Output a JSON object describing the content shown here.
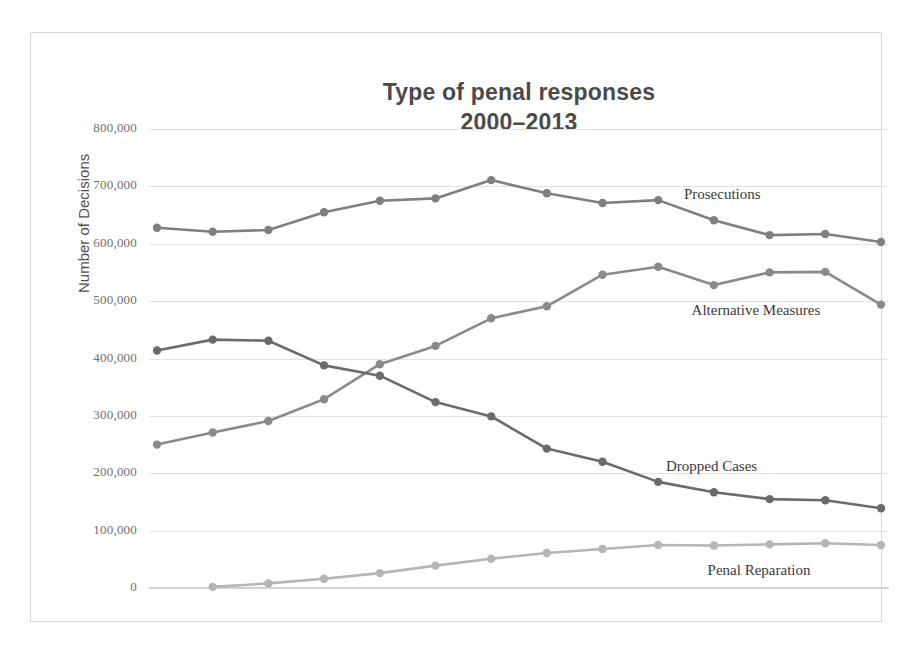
{
  "chart_data": {
    "type": "line",
    "title": "Type of penal responses",
    "subtitle": "2000–2013",
    "xlabel": "",
    "ylabel": "Number of Decisions",
    "categories": [
      "2000",
      "2001",
      "2002",
      "2003",
      "2004",
      "2005",
      "2006",
      "2007",
      "2008",
      "2009",
      "2010",
      "2011",
      "2012",
      "2013"
    ],
    "ylim": [
      0,
      800000
    ],
    "yticks": [
      0,
      100000,
      200000,
      300000,
      400000,
      500000,
      600000,
      700000,
      800000
    ],
    "ytick_labels": [
      "0",
      "100,000",
      "200,000",
      "300,000",
      "400,000",
      "500,000",
      "600,000",
      "700,000",
      "800,000"
    ],
    "grid": true,
    "legend_position": "inline-right-of-series",
    "series": [
      {
        "name": "Prosecutions",
        "color": "#7f7f7f",
        "values": [
          628000,
          621000,
          624000,
          655000,
          675000,
          679000,
          711000,
          688000,
          671000,
          676000,
          641000,
          615000,
          617000,
          603000
        ]
      },
      {
        "name": "Alternative Measures",
        "color": "#8a8a8a",
        "values": [
          250000,
          271000,
          291000,
          329000,
          390000,
          422000,
          470000,
          491000,
          546000,
          560000,
          528000,
          550000,
          551000,
          494000
        ]
      },
      {
        "name": "Dropped Cases",
        "color": "#6b6b6b",
        "values": [
          414000,
          433000,
          431000,
          388000,
          370000,
          324000,
          299000,
          243000,
          220000,
          185000,
          167000,
          155000,
          153000,
          139000
        ]
      },
      {
        "name": "Penal Reparation",
        "color": "#b5b5b5",
        "values": [
          null,
          2000,
          8000,
          16000,
          26000,
          39000,
          51000,
          61000,
          68000,
          75000,
          74000,
          76000,
          78000,
          75000
        ]
      }
    ]
  },
  "axis": {
    "y_title": "Number of Decisions"
  },
  "labels": {
    "prosecutions": "Prosecutions",
    "alternative_measures": "Alternative Measures",
    "dropped_cases": "Dropped Cases",
    "penal_reparation": "Penal Reparation"
  }
}
